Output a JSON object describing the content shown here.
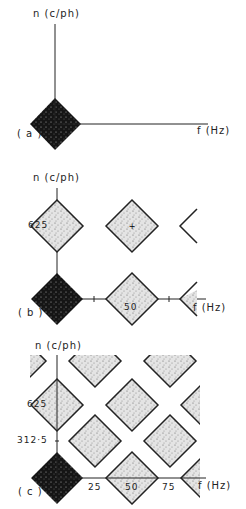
{
  "panels": [
    {
      "id": "a",
      "label": "( a )",
      "y_axis_label": "n (c/ph)",
      "x_axis_label": "f (Hz)",
      "y_ticks": [],
      "x_ticks": []
    },
    {
      "id": "b",
      "label": "( b )",
      "y_axis_label": "n (c/ph)",
      "x_axis_label": "f (Hz)",
      "y_ticks": [
        "625"
      ],
      "x_ticks": [
        "50"
      ]
    },
    {
      "id": "c",
      "label": "( c )",
      "y_axis_label": "n (c/ph)",
      "x_axis_label": "f (Hz)",
      "y_ticks": [
        "625",
        "312·5"
      ],
      "x_ticks": [
        "25",
        "50",
        "75"
      ]
    }
  ],
  "colors": {
    "baseband": "#111111",
    "replica": "#d8d8d8",
    "outline": "#222222"
  }
}
